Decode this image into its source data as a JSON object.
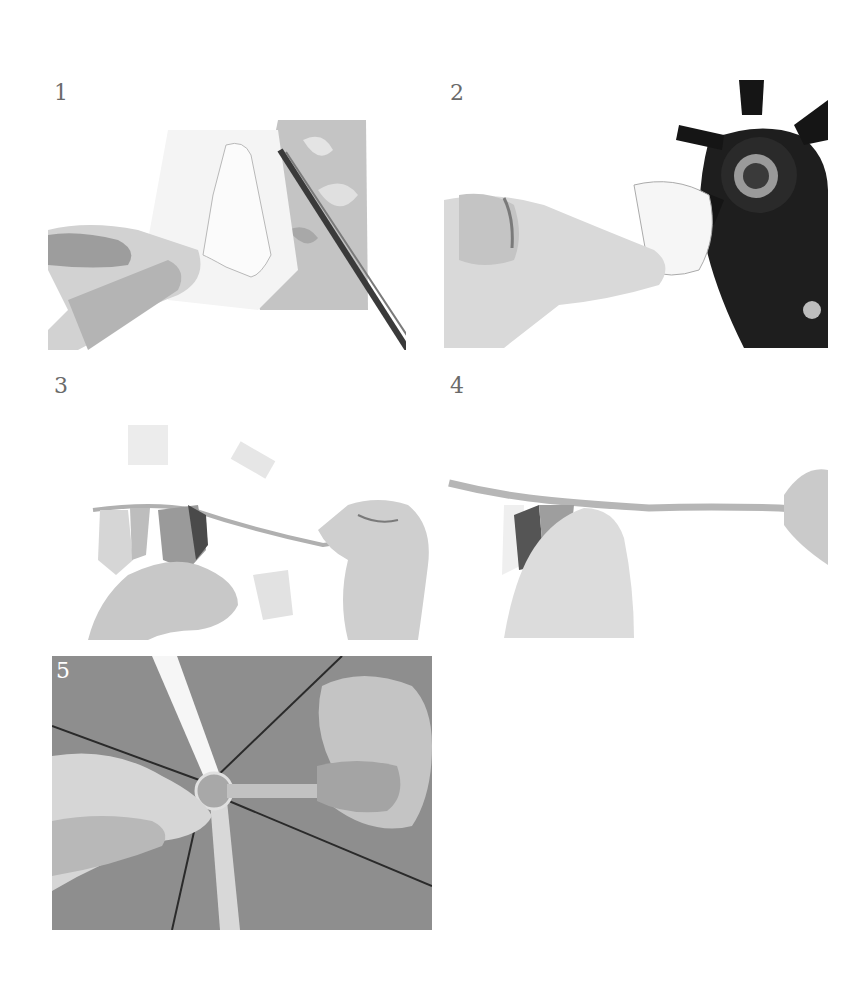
{
  "steps": [
    {
      "number": "1",
      "description": "Hand holding a patterned paper square while scissors cut out a pennant shape"
    },
    {
      "number": "2",
      "description": "Hand holding a cut paper piece inside a rotary hole punch"
    },
    {
      "number": "3",
      "description": "Threading paper pennants onto a narrow ribbon"
    },
    {
      "number": "4",
      "description": "Sliding the pennants along the stretched ribbon"
    },
    {
      "number": "5",
      "description": "Tying ribbon knot at the centre of an umbrella's spokes"
    }
  ],
  "colors": {
    "background": "#ffffff",
    "number_text": "#6a6a6a",
    "skin_light": "#e9e9e9",
    "skin_shadow": "#8a8a8a",
    "paper_gray": "#c8c8c8",
    "tool_black": "#1a1a1a",
    "umbrella_gray": "#8e8e8e"
  }
}
